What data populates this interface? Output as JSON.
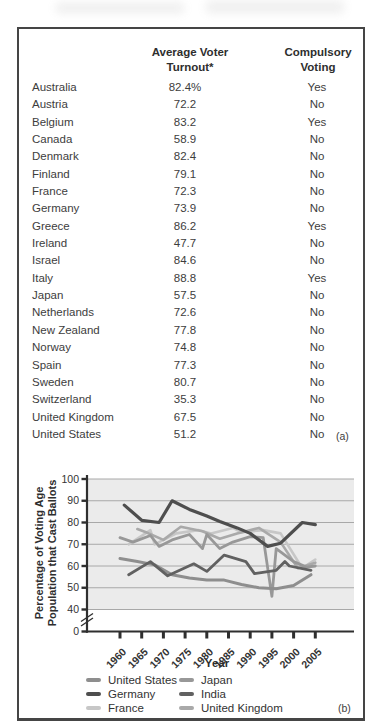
{
  "panel_a": {
    "header": {
      "turnout_line1": "Average Voter",
      "turnout_line2": "Turnout*",
      "voting_line1": "Compulsory",
      "voting_line2": "Voting"
    },
    "rows": [
      {
        "country": "Australia",
        "turnout": "82.4%",
        "compulsory": "Yes"
      },
      {
        "country": "Austria",
        "turnout": "72.2",
        "compulsory": "No"
      },
      {
        "country": "Belgium",
        "turnout": "83.2",
        "compulsory": "Yes"
      },
      {
        "country": "Canada",
        "turnout": "58.9",
        "compulsory": "No"
      },
      {
        "country": "Denmark",
        "turnout": "82.4",
        "compulsory": "No"
      },
      {
        "country": "Finland",
        "turnout": "79.1",
        "compulsory": "No"
      },
      {
        "country": "France",
        "turnout": "72.3",
        "compulsory": "No"
      },
      {
        "country": "Germany",
        "turnout": "73.9",
        "compulsory": "No"
      },
      {
        "country": "Greece",
        "turnout": "86.2",
        "compulsory": "Yes"
      },
      {
        "country": "Ireland",
        "turnout": "47.7",
        "compulsory": "No"
      },
      {
        "country": "Israel",
        "turnout": "84.6",
        "compulsory": "No"
      },
      {
        "country": "Italy",
        "turnout": "88.8",
        "compulsory": "Yes"
      },
      {
        "country": "Japan",
        "turnout": "57.5",
        "compulsory": "No"
      },
      {
        "country": "Netherlands",
        "turnout": "72.6",
        "compulsory": "No"
      },
      {
        "country": "New Zealand",
        "turnout": "77.8",
        "compulsory": "No"
      },
      {
        "country": "Norway",
        "turnout": "74.8",
        "compulsory": "No"
      },
      {
        "country": "Spain",
        "turnout": "77.3",
        "compulsory": "No"
      },
      {
        "country": "Sweden",
        "turnout": "80.7",
        "compulsory": "No"
      },
      {
        "country": "Switzerland",
        "turnout": "35.3",
        "compulsory": "No"
      },
      {
        "country": "United Kingdom",
        "turnout": "67.5",
        "compulsory": "No"
      },
      {
        "country": "United States",
        "turnout": "51.2",
        "compulsory": "No"
      }
    ],
    "marker": "(a)"
  },
  "chart_data": {
    "type": "line",
    "xlabel": "Year",
    "ylabel": "Percentage of Voting Age Population that Cast Ballots",
    "ylabel_lines": [
      "Percentage of Voting Age",
      "Population that Cast Ballots"
    ],
    "x_ticks": [
      1960,
      1965,
      1970,
      1975,
      1980,
      1985,
      1990,
      1995,
      2000,
      2005
    ],
    "y_ticks": [
      0,
      40,
      50,
      60,
      70,
      80,
      90,
      100
    ],
    "ylim": [
      0,
      100
    ],
    "xlim": [
      1958,
      2008
    ],
    "axis_break_between": [
      0,
      40
    ],
    "grid": true,
    "legend_position": "bottom",
    "plot_bg_color": "#ebebeb",
    "grid_color": "#a8a8a8",
    "axis_color": "#2f2f2f",
    "series": [
      {
        "name": "United States",
        "color": "#8e8e8e",
        "width": 3,
        "points": [
          [
            1960,
            63.5
          ],
          [
            1964,
            62
          ],
          [
            1968,
            60.5
          ],
          [
            1972,
            56
          ],
          [
            1976,
            54.5
          ],
          [
            1980,
            53.5
          ],
          [
            1984,
            53.5
          ],
          [
            1988,
            51.5
          ],
          [
            1992,
            50
          ],
          [
            1996,
            49.5
          ],
          [
            2000,
            51
          ],
          [
            2004,
            56
          ]
        ]
      },
      {
        "name": "Germany",
        "color": "#4e4e4e",
        "width": 3.2,
        "points": [
          [
            1961,
            88
          ],
          [
            1965,
            81
          ],
          [
            1969,
            80
          ],
          [
            1972,
            90
          ],
          [
            1976,
            86
          ],
          [
            1980,
            83
          ],
          [
            1983,
            80.5
          ],
          [
            1987,
            77.5
          ],
          [
            1990,
            75
          ],
          [
            1994,
            69
          ],
          [
            1997,
            70.5
          ],
          [
            2002,
            80
          ],
          [
            2005,
            79
          ]
        ]
      },
      {
        "name": "France",
        "color": "#c7c7c7",
        "width": 2.6,
        "points": [
          [
            1962,
            70
          ],
          [
            1967,
            76.5
          ],
          [
            1968,
            70
          ],
          [
            1973,
            75
          ],
          [
            1978,
            76.5
          ],
          [
            1981,
            75
          ],
          [
            1986,
            77.5
          ],
          [
            1988,
            75.5
          ],
          [
            1993,
            76.5
          ],
          [
            1997,
            75
          ],
          [
            2002,
            59
          ],
          [
            2005,
            63
          ]
        ]
      },
      {
        "name": "Japan",
        "color": "#989898",
        "width": 2.8,
        "points": [
          [
            1960,
            73
          ],
          [
            1963,
            71
          ],
          [
            1967,
            74
          ],
          [
            1969,
            69
          ],
          [
            1972,
            72
          ],
          [
            1976,
            74.5
          ],
          [
            1979,
            68
          ],
          [
            1980,
            74.5
          ],
          [
            1983,
            68
          ],
          [
            1986,
            71
          ],
          [
            1990,
            73.5
          ],
          [
            1993,
            73
          ],
          [
            1995,
            46
          ],
          [
            1996,
            68
          ],
          [
            2000,
            62
          ],
          [
            2003,
            59.5
          ],
          [
            2005,
            60
          ]
        ]
      },
      {
        "name": "India",
        "color": "#616161",
        "width": 2.8,
        "points": [
          [
            1962,
            56
          ],
          [
            1967,
            62
          ],
          [
            1971,
            55.5
          ],
          [
            1977,
            61
          ],
          [
            1980,
            57.5
          ],
          [
            1984,
            65
          ],
          [
            1989,
            62
          ],
          [
            1991,
            56.5
          ],
          [
            1996,
            58
          ],
          [
            1998,
            62
          ],
          [
            1999,
            60
          ],
          [
            2004,
            58
          ]
        ]
      },
      {
        "name": "United Kingdom",
        "color": "#a9a9a9",
        "width": 2.6,
        "points": [
          [
            1964,
            77
          ],
          [
            1966,
            75.5
          ],
          [
            1970,
            72
          ],
          [
            1974,
            78
          ],
          [
            1979,
            76
          ],
          [
            1983,
            72.5
          ],
          [
            1987,
            75
          ],
          [
            1992,
            77.5
          ],
          [
            1997,
            71
          ],
          [
            2001,
            59
          ],
          [
            2005,
            61.5
          ]
        ]
      }
    ],
    "legend_columns": [
      [
        "United States",
        "Germany",
        "France"
      ],
      [
        "Japan",
        "India",
        "United Kingdom"
      ]
    ],
    "marker": "(b)"
  }
}
